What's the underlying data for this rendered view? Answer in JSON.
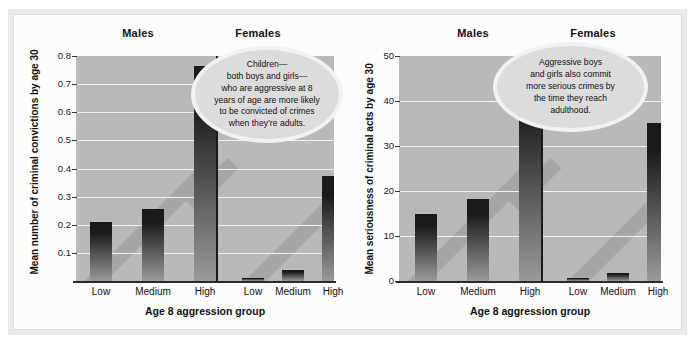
{
  "figure": {
    "background_color": "#ffffff",
    "frame_color": "#e9e9e9",
    "plot_background": "#b9b9b9",
    "gridline_color": "#f2f2f2",
    "bar_color_top": "#1a1a1a",
    "bar_color_bottom": "#9a9a9a"
  },
  "charts": [
    {
      "id": "criminal-convictions",
      "group_headers": {
        "males": "Males",
        "females": "Females"
      },
      "ylabel": "Mean number of criminal convictions by age 30",
      "xlabel": "Age 8 aggression group",
      "yticks": [
        "0.8",
        "0.7",
        "0.6",
        "0.5",
        "0.4",
        "0.3",
        "0.2",
        "0.1"
      ],
      "xticks": [
        "Low",
        "Medium",
        "High",
        "Low",
        "Medium",
        "High"
      ],
      "callout": {
        "lines": [
          "Children—",
          "both boys  and girls—",
          "who are aggressive at 8",
          "years of age are more likely",
          "to be convicted of crimes",
          "when they’re adults."
        ]
      }
    },
    {
      "id": "criminal-seriousness",
      "group_headers": {
        "males": "Males",
        "females": "Females"
      },
      "ylabel": "Mean seriousness of criminal acts by age 30",
      "xlabel": "Age 8 aggression group",
      "yticks": [
        "50",
        "40",
        "30",
        "20",
        "10",
        "0"
      ],
      "xticks": [
        "Low",
        "Medium",
        "High",
        "Low",
        "Medium",
        "High"
      ],
      "callout": {
        "lines": [
          "Aggressive boys",
          "and girls also commit",
          "more serious crimes by",
          "the time they reach",
          "adulthood."
        ]
      }
    }
  ],
  "chart_data": [
    {
      "type": "bar",
      "id": "criminal-convictions",
      "title": "",
      "xlabel": "Age 8 aggression group",
      "ylabel": "Mean number of criminal convictions by age 30",
      "ylim": [
        0,
        0.8
      ],
      "yticks": [
        0.1,
        0.2,
        0.3,
        0.4,
        0.5,
        0.6,
        0.7,
        0.8
      ],
      "grid": true,
      "legend": "none",
      "groups": [
        "Males",
        "Females"
      ],
      "categories": [
        "Low",
        "Medium",
        "High",
        "Low",
        "Medium",
        "High"
      ],
      "series": [
        {
          "name": "Males",
          "categories": [
            "Low",
            "Medium",
            "High"
          ],
          "values": [
            0.21,
            0.255,
            0.765
          ]
        },
        {
          "name": "Females",
          "categories": [
            "Low",
            "Medium",
            "High"
          ],
          "values": [
            0.01,
            0.04,
            0.375
          ]
        }
      ],
      "values": [
        0.21,
        0.255,
        0.765,
        0.01,
        0.04,
        0.375
      ]
    },
    {
      "type": "bar",
      "id": "criminal-seriousness",
      "title": "",
      "xlabel": "Age 8 aggression group",
      "ylabel": "Mean seriousness of criminal acts by age 30",
      "ylim": [
        0,
        50
      ],
      "yticks": [
        0,
        10,
        20,
        30,
        40,
        50
      ],
      "grid": true,
      "legend": "none",
      "groups": [
        "Males",
        "Females"
      ],
      "categories": [
        "Low",
        "Medium",
        "High",
        "Low",
        "Medium",
        "High"
      ],
      "series": [
        {
          "name": "Males",
          "categories": [
            "Low",
            "Medium",
            "High"
          ],
          "values": [
            15,
            18.2,
            46.5
          ]
        },
        {
          "name": "Females",
          "categories": [
            "Low",
            "Medium",
            "High"
          ],
          "values": [
            0.6,
            1.8,
            35.2
          ]
        }
      ],
      "values": [
        15,
        18.2,
        46.5,
        0.6,
        1.8,
        35.2
      ]
    }
  ]
}
